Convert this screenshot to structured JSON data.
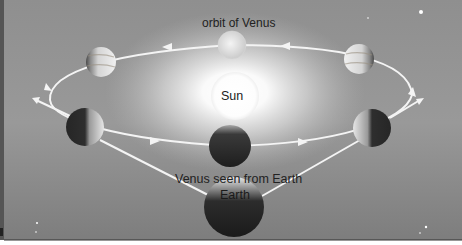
{
  "diagram": {
    "labels": {
      "orbit": "orbit of Venus",
      "sun": "Sun",
      "seen_from": "Venus seen from Earth",
      "earth": "Earth"
    },
    "bodies": [
      {
        "name": "Sun",
        "x": 235,
        "y": 96,
        "r": 24
      },
      {
        "name": "Venus (full, far side)",
        "x": 232,
        "y": 45,
        "r": 14,
        "phase": "full"
      },
      {
        "name": "Venus (gibbous, upper left)",
        "x": 101,
        "y": 62,
        "r": 15,
        "phase": "gibbous"
      },
      {
        "name": "Venus (gibbous, upper right)",
        "x": 359,
        "y": 59,
        "r": 15,
        "phase": "gibbous"
      },
      {
        "name": "Venus (crescent, left)",
        "x": 85,
        "y": 127,
        "r": 19,
        "phase": "half/crescent"
      },
      {
        "name": "Venus (new, near side)",
        "x": 230,
        "y": 146,
        "r": 21,
        "phase": "new"
      },
      {
        "name": "Venus (crescent, right)",
        "x": 372,
        "y": 128,
        "r": 19,
        "phase": "half/crescent"
      },
      {
        "name": "Earth",
        "x": 234,
        "y": 206,
        "r": 30
      }
    ],
    "colors": {
      "background": "#8a8a8a",
      "orbit_line": "#f4f4f4",
      "label_text": "#222222"
    }
  }
}
